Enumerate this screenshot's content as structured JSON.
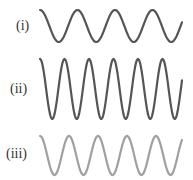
{
  "waves": [
    {
      "label": "(i)",
      "color": "#555555",
      "period_px": 37.5,
      "amplitude_px": 16,
      "center_y": 26,
      "x_start": 40,
      "x_end": 182,
      "phase": "start-at-crest"
    },
    {
      "label": "(ii)",
      "color": "#555555",
      "period_px": 24.5,
      "amplitude_px": 30,
      "center_y": 89,
      "x_start": 40,
      "x_end": 182,
      "phase": "start-at-crest"
    },
    {
      "label": "(iii)",
      "color": "#a0a0a0",
      "period_px": 29,
      "amplitude_px": 19.5,
      "center_y": 155.5,
      "x_start": 40,
      "x_end": 182,
      "phase": "start-at-crest"
    }
  ]
}
